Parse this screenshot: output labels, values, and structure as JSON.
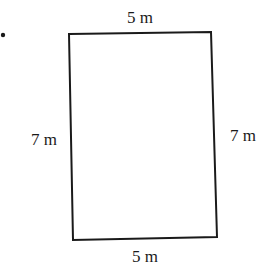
{
  "diagram": {
    "type": "rectangle",
    "labels": {
      "top": "5 m",
      "bottom": "5 m",
      "left": "7 m",
      "right": "7 m"
    },
    "stroke_color": "#1a1a1a",
    "background": "#ffffff"
  }
}
